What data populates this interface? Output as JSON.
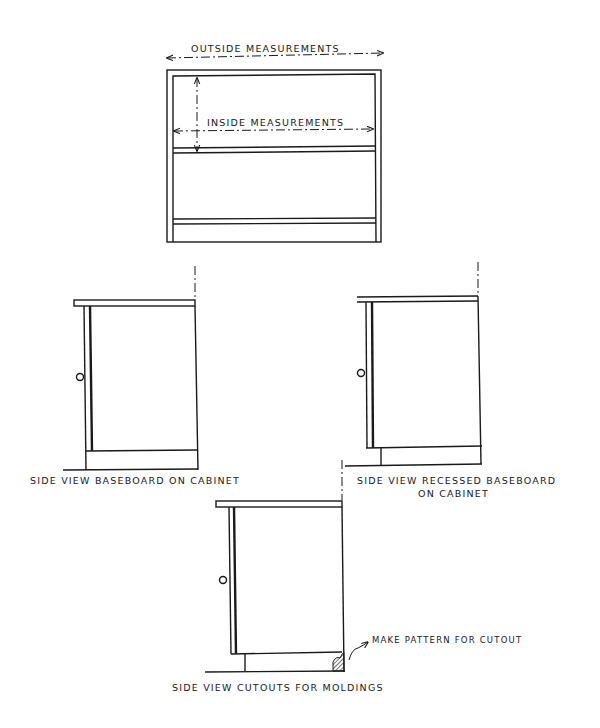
{
  "figure": {
    "front_view": {
      "outside_label": "OUTSIDE MEASUREMENTS",
      "inside_label": "INSIDE MEASUREMENTS"
    },
    "side_view_1": {
      "caption": "SIDE VIEW BASEBOARD ON CABINET"
    },
    "side_view_2": {
      "caption_line1": "SIDE VIEW RECESSED BASEBOARD",
      "caption_line2": "ON CABINET"
    },
    "side_view_3": {
      "caption": "SIDE VIEW CUTOUTS FOR MOLDINGS",
      "callout": "MAKE PATTERN FOR CUTOUT"
    }
  }
}
